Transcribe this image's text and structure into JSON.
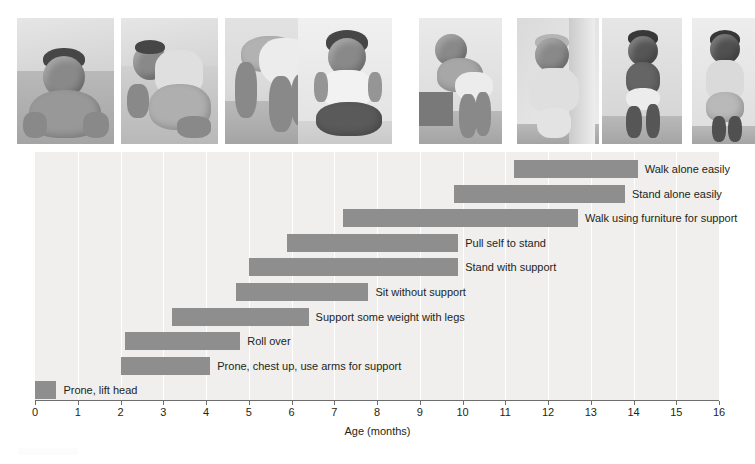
{
  "figure": {
    "type": "photo-illustrated-range-chart",
    "photo_strip": {
      "count": 8,
      "description": "Eight black-and-white photographs of infants showing progressive motor milestones",
      "photos": [
        {
          "name": "photo-prone-lift-head",
          "alt": "Baby lying prone lifting head and chest"
        },
        {
          "name": "photo-roll-over",
          "alt": "Baby rolling over onto side"
        },
        {
          "name": "photo-support-weight-legs",
          "alt": "Baby on hands and feet supporting weight with legs"
        },
        {
          "name": "photo-sit-without-support",
          "alt": "Baby sitting upright without support"
        },
        {
          "name": "photo-pull-self-to-stand",
          "alt": "Baby pulling self up to stand at a low table"
        },
        {
          "name": "photo-stand-with-support",
          "alt": "Baby standing while holding onto a curtain"
        },
        {
          "name": "photo-walk-with-help",
          "alt": "Baby walking while held by an adult's hands"
        },
        {
          "name": "photo-walk-alone",
          "alt": "Toddler walking alone in profile"
        }
      ]
    }
  },
  "chart_data": {
    "type": "bar",
    "orientation": "horizontal-range",
    "title": "",
    "xlabel": "Age (months)",
    "ylabel": "Degree of motor development",
    "xlim": [
      0,
      16
    ],
    "xticks": [
      0,
      1,
      2,
      3,
      4,
      5,
      6,
      7,
      8,
      9,
      10,
      11,
      12,
      13,
      14,
      15,
      16
    ],
    "xtick_labels": [
      "0",
      "1",
      "2",
      "3",
      "4",
      "5",
      "6",
      "7",
      "8",
      "9",
      "10",
      "11",
      "12",
      "13",
      "14",
      "15",
      "16"
    ],
    "grid": "vertical",
    "legend": "none",
    "bar_color": "#8e8e8e",
    "plot_background": "#f0efed",
    "gridline_color": "#ffffff",
    "units": "months",
    "value_key": "range = [start_month, end_month]",
    "categories": [
      "Walk alone easily",
      "Stand alone easily",
      "Walk using furniture for support",
      "Pull self to stand",
      "Stand with support",
      "Sit without support",
      "Support some weight with legs",
      "Roll over",
      "Prone, chest up, use arms for support",
      "Prone, lift head"
    ],
    "bars": [
      {
        "label": "Walk alone easily",
        "start": 11.2,
        "end": 14.1
      },
      {
        "label": "Stand alone easily",
        "start": 9.8,
        "end": 13.8
      },
      {
        "label": "Walk using furniture for support",
        "start": 7.2,
        "end": 12.7
      },
      {
        "label": "Pull self to stand",
        "start": 5.9,
        "end": 9.9
      },
      {
        "label": "Stand with support",
        "start": 5.0,
        "end": 9.9
      },
      {
        "label": "Sit without support",
        "start": 4.7,
        "end": 7.8
      },
      {
        "label": "Support some weight with legs",
        "start": 3.2,
        "end": 6.4
      },
      {
        "label": "Roll over",
        "start": 2.1,
        "end": 4.8
      },
      {
        "label": "Prone, chest up, use arms for support",
        "start": 2.0,
        "end": 4.1
      },
      {
        "label": "Prone, lift head",
        "start": 0.0,
        "end": 0.5
      }
    ]
  }
}
